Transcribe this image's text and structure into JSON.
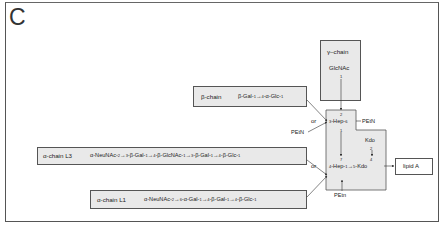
{
  "panel": {
    "letter": "C"
  },
  "gamma_chain": {
    "name": "γ–chain",
    "residue": "GlcNAc",
    "link_from": "1",
    "link_to": "2"
  },
  "beta_chain": {
    "name": "β-chain",
    "seq": [
      "β-Gal-",
      "1",
      "→",
      "4",
      "-α-Glc-",
      "1"
    ]
  },
  "alpha_l3": {
    "name": "α-chain L3",
    "seq": [
      "α-NeuNAc-",
      "2",
      "→",
      "3",
      "-β-Gal-",
      "1",
      "→",
      "4",
      "-β-GlcNAc-",
      "1",
      "→",
      "3",
      "-β-Gal-",
      "1",
      "→",
      "4",
      "-β-Glc-",
      "1"
    ]
  },
  "alpha_l1": {
    "name": "α-chain L1",
    "seq": [
      "α-NeuNAc-",
      "2",
      "→",
      "6",
      "-α-Gal-",
      "1",
      "→",
      "4",
      "-β-Gal-",
      "1",
      "→",
      "4",
      "-β-Glc-",
      "1"
    ]
  },
  "core": {
    "hep_top": {
      "pre": "3",
      "name": "-Hep-",
      "post": "6"
    },
    "hep_top_sub": "PEtN",
    "hep_top_pos_above": "2",
    "hep_link_from": "1",
    "hep_link_to": "7",
    "hep_bottom": {
      "pre": "4",
      "name": "-Hep-",
      "post": "1"
    },
    "kdo_side": {
      "name": "Kdo",
      "from": "2",
      "to": "4"
    },
    "kdo_main": {
      "pre": "5",
      "name": "-Kdo"
    },
    "hep_bottom_sub": "PEtn"
  },
  "or_labels": [
    "or",
    "or"
  ],
  "petn_left": "PEtN",
  "lipid_a": {
    "label": "lipid A"
  }
}
